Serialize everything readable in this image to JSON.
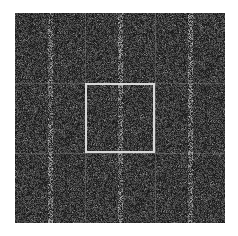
{
  "image": {
    "description": "3x3 tiled grid of noisy grayscale image patches with faint vertical streaks, center tile highlighted by a white square outline",
    "background_color": "#ffffff",
    "grid": {
      "rows": 3,
      "cols": 3,
      "left": 15,
      "top": 13,
      "tile_size": 70,
      "base_color": "#1c1c1c",
      "gridline_color": "#969696"
    },
    "highlight": {
      "row": 1,
      "col": 1,
      "color": "#d8d8d8",
      "stroke_width": 2
    },
    "streak_offset_in_tile": 35
  }
}
